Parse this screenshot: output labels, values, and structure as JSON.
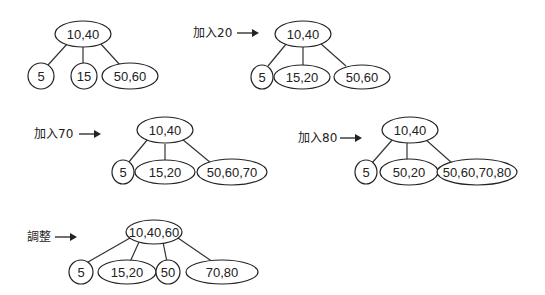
{
  "accent_color": "#222222",
  "steps": [
    {
      "label": "",
      "root": "10,40",
      "children": [
        "5",
        "15",
        "50,60"
      ]
    },
    {
      "label": "加入20",
      "root": "10,40",
      "children": [
        "5",
        "15,20",
        "50,60"
      ]
    },
    {
      "label": "加入70",
      "root": "10,40",
      "children": [
        "5",
        "15,20",
        "50,60,70"
      ]
    },
    {
      "label": "加入80",
      "root": "10,40",
      "children": [
        "5",
        "50,20",
        "50,60,70,80"
      ]
    },
    {
      "label": "調整",
      "root": "10,40,60",
      "children": [
        "5",
        "15,20",
        "50",
        "70,80"
      ]
    }
  ]
}
